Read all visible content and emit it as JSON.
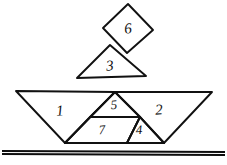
{
  "figure": {
    "background_color": "#ffffff",
    "ink_color": "#111111",
    "stroke_style": "hand-drawn pen outline"
  },
  "pieces": [
    {
      "id": "piece-1",
      "label": "1",
      "shape": "large-triangle",
      "points": "16,91 115,92 65,143",
      "label_x": 60,
      "label_y": 112,
      "label_size": 15,
      "label_rotation": -4
    },
    {
      "id": "piece-2",
      "label": "2",
      "shape": "large-triangle",
      "points": "212,92 113,92 164,143",
      "label_x": 159,
      "label_y": 111,
      "label_size": 15,
      "label_rotation": -4
    },
    {
      "id": "piece-5",
      "label": "5",
      "shape": "medium-triangle",
      "points": "115,92 90,117 140,117",
      "label_x": 114,
      "label_y": 106,
      "label_size": 13,
      "label_rotation": -5
    },
    {
      "id": "piece-7",
      "label": "7",
      "shape": "parallelogram",
      "points": "90,117 140,117 127,143 65,143",
      "label_x": 102,
      "label_y": 131,
      "label_size": 13,
      "label_rotation": -4
    },
    {
      "id": "piece-4",
      "label": "4",
      "shape": "small-triangle",
      "points": "140,117 164,143 127,143",
      "label_x": 139,
      "label_y": 131,
      "label_size": 13,
      "label_rotation": -3
    },
    {
      "id": "piece-3",
      "label": "3",
      "shape": "triangle-sail",
      "points": "110,45 77,78 146,76",
      "label_x": 110,
      "label_y": 67,
      "label_size": 15,
      "label_rotation": -5
    },
    {
      "id": "piece-6",
      "label": "6",
      "shape": "square-diamond",
      "points": "128,4 153,30 127,53 103,28",
      "label_x": 128,
      "label_y": 30,
      "label_size": 15,
      "label_rotation": -6
    }
  ],
  "dividers": [
    {
      "id": "divider-1-7",
      "d": "M 65,143 L 115,92"
    },
    {
      "id": "divider-5-7",
      "d": "M 90,117 L 140,117"
    },
    {
      "id": "divider-7-4",
      "d": "M 140,117 L 127,143"
    },
    {
      "id": "divider-4-2",
      "d": "M 140,117 L 164,143"
    },
    {
      "id": "divider-5-2",
      "d": "M 115,92 L 140,117"
    }
  ],
  "ground": {
    "id": "ground-line",
    "label": "ground-line",
    "d": "M 2,151 L 225,152",
    "second_d": "M 2,154 L 225,155"
  }
}
